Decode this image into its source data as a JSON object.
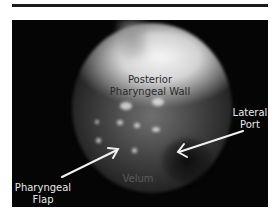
{
  "figure": {
    "labels": {
      "posterior_wall_line1": "Posterior",
      "posterior_wall_line2": "Pharyngeal Wall",
      "lateral_port_line1": "Lateral",
      "lateral_port_line2": "Port",
      "velum": "Velum",
      "pharyngeal_flap_line1": "Pharyngeal",
      "pharyngeal_flap_line2": "Flap"
    },
    "colors": {
      "background": "#050505",
      "arrow": "#f0f0f0",
      "rule": "#1a1a1a"
    }
  }
}
